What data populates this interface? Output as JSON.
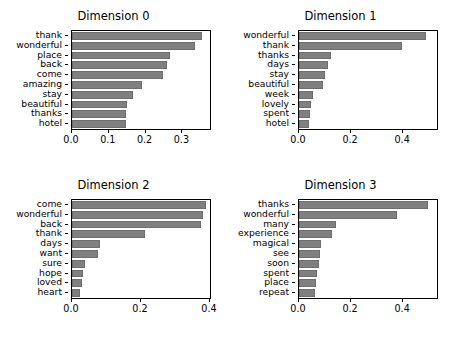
{
  "figure": {
    "width": 454,
    "height": 339,
    "background": "#ffffff",
    "bar_color": "#808080",
    "axis_color": "#000000",
    "rows": 2,
    "cols": 2
  },
  "chart_data": [
    {
      "type": "bar",
      "orientation": "horizontal",
      "title": "Dimension 0",
      "xlabel": "",
      "ylabel": "",
      "categories": [
        "thank",
        "wonderful",
        "place",
        "back",
        "come",
        "amazing",
        "stay",
        "beautiful",
        "thanks",
        "hotel"
      ],
      "values": [
        0.352,
        0.335,
        0.265,
        0.257,
        0.246,
        0.19,
        0.167,
        0.15,
        0.148,
        0.147
      ],
      "xticks": [
        0.0,
        0.1,
        0.2,
        0.3
      ],
      "xticklabels": [
        "0.0",
        "0.1",
        "0.2",
        "0.3"
      ],
      "xlim": [
        0.0,
        0.375
      ],
      "grid": false,
      "legend": null
    },
    {
      "type": "bar",
      "orientation": "horizontal",
      "title": "Dimension 1",
      "xlabel": "",
      "ylabel": "",
      "categories": [
        "wonderful",
        "thank",
        "thanks",
        "days",
        "stay",
        "beautiful",
        "week",
        "lovely",
        "spent",
        "hotel"
      ],
      "values": [
        0.487,
        0.396,
        0.122,
        0.113,
        0.1,
        0.092,
        0.053,
        0.046,
        0.041,
        0.039
      ],
      "xticks": [
        0.0,
        0.2,
        0.4
      ],
      "xticklabels": [
        "0.0",
        "0.2",
        "0.4"
      ],
      "xlim": [
        0.0,
        0.53
      ],
      "grid": false,
      "legend": null
    },
    {
      "type": "bar",
      "orientation": "horizontal",
      "title": "Dimension 2",
      "xlabel": "",
      "ylabel": "",
      "categories": [
        "come",
        "wonderful",
        "back",
        "thank",
        "days",
        "want",
        "sure",
        "hope",
        "loved",
        "heart"
      ],
      "values": [
        0.389,
        0.38,
        0.374,
        0.213,
        0.082,
        0.076,
        0.038,
        0.032,
        0.03,
        0.023
      ],
      "xticks": [
        0.0,
        0.2,
        0.4
      ],
      "xticklabels": [
        "0.0",
        "0.2",
        "0.4"
      ],
      "xlim": [
        0.0,
        0.4
      ],
      "grid": false,
      "legend": null
    },
    {
      "type": "bar",
      "orientation": "horizontal",
      "title": "Dimension 3",
      "xlabel": "",
      "ylabel": "",
      "categories": [
        "thanks",
        "wonderful",
        "many",
        "experience",
        "magical",
        "see",
        "soon",
        "spent",
        "place",
        "repeat"
      ],
      "values": [
        0.497,
        0.376,
        0.144,
        0.128,
        0.086,
        0.079,
        0.078,
        0.07,
        0.066,
        0.063
      ],
      "xticks": [
        0.0,
        0.2,
        0.4
      ],
      "xticklabels": [
        "0.0",
        "0.2",
        "0.4"
      ],
      "xlim": [
        0.0,
        0.53
      ],
      "grid": false,
      "legend": null
    }
  ]
}
